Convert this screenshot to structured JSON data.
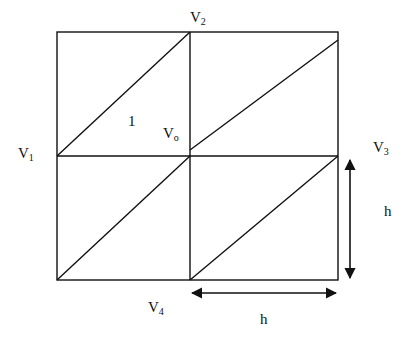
{
  "diagram": {
    "type": "triangulated-grid",
    "labels": {
      "v1": {
        "main": "V",
        "sub": "1"
      },
      "v2": {
        "main": "V",
        "sub": "2"
      },
      "v3": {
        "main": "V",
        "sub": "3"
      },
      "v4": {
        "main": "V",
        "sub": "4"
      },
      "v0": {
        "main": "V",
        "sub": "o"
      },
      "triangle_1": "1",
      "height_dim": "h",
      "width_dim": "h"
    },
    "stroke_color": "#111111"
  }
}
